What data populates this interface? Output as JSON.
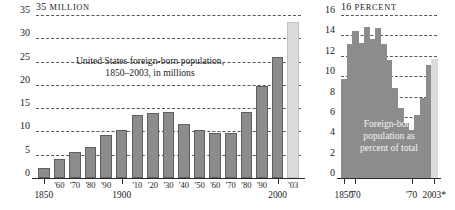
{
  "chart_data": [
    {
      "id": "foreign-born-millions",
      "type": "bar",
      "title": "United States foreign-born population, 1850–2003, in millions",
      "title_line1": "United States foreign-born population,",
      "title_line2": "1850–2003, in millions",
      "unit_number": "35",
      "unit_word": "MILLION",
      "xlabel": "",
      "ylabel": "MILLION",
      "ylim": [
        0,
        35
      ],
      "yticks": [
        0,
        5,
        10,
        15,
        20,
        25,
        30,
        35
      ],
      "ytick_labels": [
        "0",
        "5",
        "10",
        "15",
        "20",
        "25",
        "30",
        "35"
      ],
      "grid": true,
      "legend": "none",
      "categories": [
        "1850",
        "'60",
        "'70",
        "'80",
        "'90",
        "1900",
        "'10",
        "'20",
        "'30",
        "'40",
        "'50",
        "'60",
        "'70",
        "'80",
        "'90",
        "2000",
        "'03"
      ],
      "major_labels": [
        "1850",
        "1900",
        "2000"
      ],
      "values": [
        2.2,
        4.1,
        5.6,
        6.7,
        9.2,
        10.3,
        13.5,
        13.9,
        14.2,
        11.6,
        10.3,
        9.7,
        9.6,
        14.1,
        19.8,
        26.0,
        33.5
      ],
      "bar_styles": [
        "solid",
        "solid",
        "solid",
        "solid",
        "solid",
        "solid",
        "solid",
        "solid",
        "solid",
        "solid",
        "solid",
        "solid",
        "solid",
        "solid",
        "solid",
        "solid",
        "projected"
      ]
    },
    {
      "id": "foreign-born-percent",
      "type": "area",
      "title": "Foreign-born population as percent of total",
      "title_line1": "Foreign-born",
      "title_line2": "population as",
      "title_line3": "percent of total",
      "unit_number": "16",
      "unit_word": "PERCENT",
      "xlabel": "",
      "ylabel": "PERCENT",
      "ylim": [
        0,
        16
      ],
      "yticks": [
        0,
        2,
        4,
        6,
        8,
        10,
        12,
        14,
        16
      ],
      "ytick_labels": [
        "0",
        "2",
        "4",
        "6",
        "8",
        "10",
        "12",
        "14",
        "16"
      ],
      "grid": true,
      "legend": "none",
      "categories": [
        "1850",
        "'60",
        "'70",
        "'80",
        "'90",
        "1900",
        "'10",
        "'20",
        "'30",
        "'40",
        "'50",
        "'60",
        "'70",
        "'80",
        "'90",
        "2000",
        "2003*"
      ],
      "major_labels": [
        "1850",
        "'70",
        "2003*"
      ],
      "values": [
        9.7,
        13.2,
        14.4,
        13.3,
        14.8,
        13.6,
        14.7,
        13.2,
        11.6,
        8.8,
        6.9,
        5.4,
        4.7,
        6.2,
        7.9,
        11.1,
        11.7
      ],
      "bar_styles": [
        "solid",
        "solid",
        "solid",
        "solid",
        "solid",
        "solid",
        "solid",
        "solid",
        "solid",
        "solid",
        "solid",
        "solid",
        "solid",
        "solid",
        "solid",
        "solid",
        "projected"
      ]
    }
  ],
  "colors": {
    "bar_fill": "#8c8c8c",
    "bar_stroke": "#5f5f5f",
    "projected_fill": "#dcdcdc",
    "gridline": "#3a3a3a",
    "axis": "#2b2b2b",
    "text": "#1a1a1a",
    "background": "#ffffff"
  }
}
